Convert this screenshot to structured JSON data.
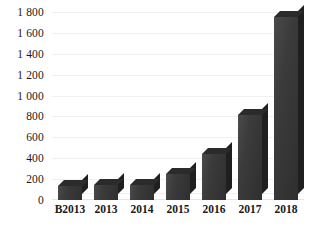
{
  "chart_data": {
    "type": "bar",
    "title": "",
    "subtitle": "",
    "xlabel": "",
    "ylabel": "",
    "categories": [
      "B2013",
      "2013",
      "2014",
      "2015",
      "2016",
      "2017",
      "2018"
    ],
    "values": [
      130,
      140,
      140,
      250,
      440,
      810,
      1750
    ],
    "series": [
      {
        "name": "",
        "values": [
          130,
          140,
          140,
          250,
          440,
          810,
          1750
        ]
      }
    ],
    "ylim": [
      0,
      1800
    ],
    "ytick_values": [
      0,
      200,
      400,
      600,
      800,
      1000,
      1200,
      1400,
      1600,
      1800
    ],
    "ytick_labels": [
      "0",
      "200",
      "400",
      "600",
      "800",
      "1 000",
      "1 200",
      "1 400",
      "1 600",
      "1 800"
    ],
    "grid": true,
    "grid_axis": "y",
    "legend": false,
    "legend_position": "none",
    "bar_color": "#3b3b3b",
    "bar_side_color": "#1f1f1f",
    "bar_top_color": "#2b2b2b",
    "gridline_color": "#f1f1f1",
    "background_color": "#ffffff",
    "text_color": "#1a1a1a",
    "three_d": true,
    "annotations": []
  }
}
